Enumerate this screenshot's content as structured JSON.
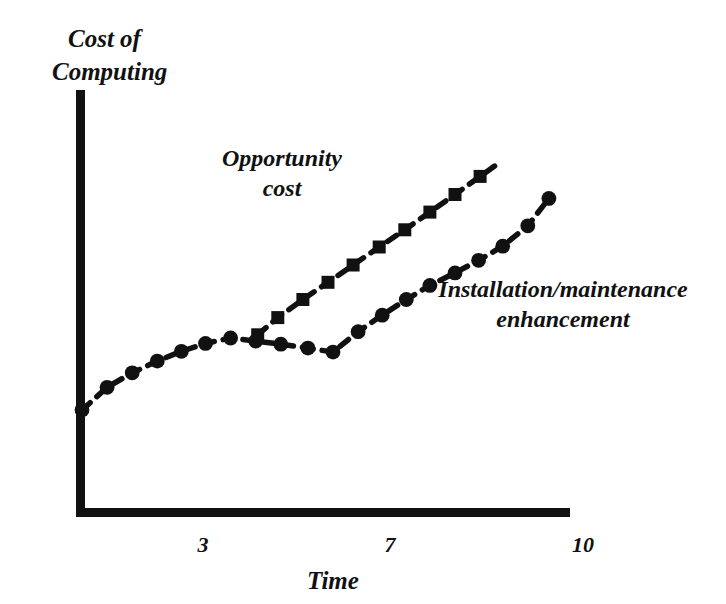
{
  "chart_data": {
    "type": "line",
    "title": "",
    "xlabel": "Time",
    "ylabel": "Cost of Computing",
    "ylabel_lines": [
      "Cost of",
      "Computing"
    ],
    "xlim": [
      0,
      10.8
    ],
    "ylim": [
      0,
      10
    ],
    "grid": false,
    "legend_position": "inline-annotation",
    "xticks": [
      3,
      7,
      10
    ],
    "xtick_labels": [
      "3",
      "7",
      "10"
    ],
    "yticks": [],
    "ytick_labels": [],
    "marker_styles": {
      "opportunity_cost": "square",
      "installation_maintenance_enhancement": "circle"
    },
    "line_style": "dashed",
    "color": "#111111",
    "series": [
      {
        "name": "Opportunity cost",
        "label_lines": [
          "Opportunity",
          "cost"
        ],
        "marker": "square",
        "x": [
          3.62,
          4.02,
          4.52,
          5.02,
          5.52,
          6.04,
          6.55,
          7.05,
          7.55,
          8.05
        ],
        "y": [
          4.52,
          4.96,
          5.42,
          5.86,
          6.3,
          6.76,
          7.2,
          7.65,
          8.1,
          8.56
        ],
        "trailing_dash": true
      },
      {
        "name": "Installation/maintenance enhancement",
        "label_lines": [
          "Installation/maintenance",
          "enhancement"
        ],
        "marker": "circle",
        "x": [
          0.12,
          0.62,
          1.12,
          1.62,
          2.1,
          2.58,
          3.08,
          3.58,
          4.08,
          4.62,
          5.12,
          5.62,
          6.1,
          6.58,
          7.05,
          7.55,
          8.02,
          8.5,
          9.0,
          9.42
        ],
        "y": [
          2.6,
          3.18,
          3.55,
          3.85,
          4.1,
          4.3,
          4.44,
          4.36,
          4.28,
          4.18,
          4.08,
          4.6,
          5.02,
          5.42,
          5.78,
          6.1,
          6.42,
          6.78,
          7.3,
          8.0
        ]
      }
    ],
    "annotations": [
      {
        "text": "Opportunity cost",
        "x": 4.0,
        "y": 8.2
      },
      {
        "text": "Installation/maintenance enhancement",
        "x": 8.2,
        "y": 4.6
      }
    ]
  },
  "axes": {
    "x_axis_label": "Time",
    "y_axis_label_line1": "Cost of",
    "y_axis_label_line2": "Computing",
    "tick_3": "3",
    "tick_7": "7",
    "tick_10": "10"
  },
  "annotations": {
    "opportunity_line1": "Opportunity",
    "opportunity_line2": "cost",
    "installation_line1": "Installation/maintenance",
    "installation_line2": "enhancement"
  },
  "geometry": {
    "origin_x": 76,
    "origin_y": 512,
    "y_axis_top": 90,
    "x_axis_right": 570,
    "x_tick_3_px": 203,
    "x_tick_7_px": 390,
    "x_tick_10_px": 578
  }
}
